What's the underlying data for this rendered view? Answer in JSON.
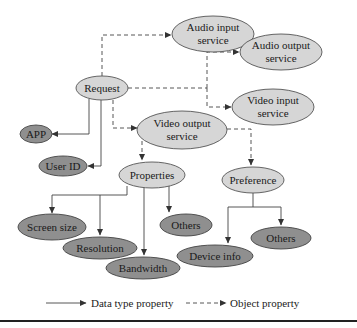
{
  "diagram": {
    "nodes": {
      "audio_input": {
        "line1": "Audio input",
        "line2": "service"
      },
      "request": {
        "label": "Request"
      },
      "audio_output": {
        "line1": "Audio output",
        "line2": "service"
      },
      "video_input": {
        "line1": "Video input",
        "line2": "service"
      },
      "video_output": {
        "line1": "Video output",
        "line2": "service"
      },
      "app": {
        "label": "APP"
      },
      "user_id": {
        "label": "User ID"
      },
      "properties": {
        "label": "Properties"
      },
      "preference": {
        "label": "Preference"
      },
      "screen_size": {
        "label": "Screen size"
      },
      "resolution": {
        "label": "Resolution"
      },
      "others_properties": {
        "label": "Others"
      },
      "bandwidth": {
        "label": "Bandwidth"
      },
      "device_info": {
        "label": "Device info"
      },
      "others_preference": {
        "label": "Others"
      }
    },
    "edges": [
      {
        "from": "Request",
        "to": "Audio input service",
        "type": "object"
      },
      {
        "from": "Request",
        "to": "Audio output service",
        "type": "object"
      },
      {
        "from": "Request",
        "to": "Video input service",
        "type": "object"
      },
      {
        "from": "Request",
        "to": "Video output service",
        "type": "object"
      },
      {
        "from": "Request",
        "to": "APP",
        "type": "data"
      },
      {
        "from": "Request",
        "to": "User ID",
        "type": "data"
      },
      {
        "from": "Video output service",
        "to": "Properties",
        "type": "object"
      },
      {
        "from": "Video output service",
        "to": "Preference",
        "type": "object"
      },
      {
        "from": "Properties",
        "to": "Screen size",
        "type": "data"
      },
      {
        "from": "Properties",
        "to": "Resolution",
        "type": "data"
      },
      {
        "from": "Properties",
        "to": "Bandwidth",
        "type": "data"
      },
      {
        "from": "Properties",
        "to": "Others",
        "type": "data"
      },
      {
        "from": "Preference",
        "to": "Device info",
        "type": "data"
      },
      {
        "from": "Preference",
        "to": "Others",
        "type": "data"
      }
    ],
    "colors": {
      "light_node": "#d6d6d6",
      "dark_node": "#8f8f8f",
      "line": "#444444"
    }
  },
  "legend": {
    "data_type_property": "Data type property",
    "object_property": "Object property"
  }
}
